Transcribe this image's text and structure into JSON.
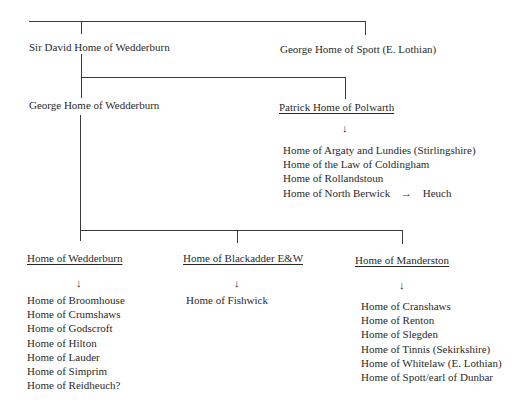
{
  "root": {
    "children": [
      "Sir David Home of Wedderburn",
      "George Home of Spott (E. Lothian)"
    ]
  },
  "sir_david": {
    "name": "Sir David Home of Wedderburn",
    "children": [
      "George Home of Wedderburn",
      "Patrick Home of Polwarth"
    ]
  },
  "george_spott": {
    "name": "George Home of Spott (E. Lothian)"
  },
  "george_wedderburn": {
    "name": "George Home of Wedderburn",
    "children": [
      "Home of Wedderburn",
      "Home of Blackadder E&W",
      "Home of Manderston"
    ]
  },
  "polwarth": {
    "name": "Patrick Home of Polwarth",
    "arrow": "↓",
    "descendants": [
      "Home of Argaty and Lundies (Stirlingshire)",
      "Home of the Law of Coldingham",
      "Home of Rollandstoun",
      "Home of North Berwick"
    ],
    "north_berwick_arrow": "→",
    "north_berwick_to": "Heuch"
  },
  "wedderburn": {
    "name": "Home of Wedderburn",
    "arrow": "↓",
    "descendants": [
      "Home of Broomhouse",
      "Home of Crumshaws",
      "Home of Godscroft",
      "Home of Hilton",
      "Home of Lauder",
      "Home of Simprim",
      "Home of Reidheuch?"
    ]
  },
  "blackadder": {
    "name": "Home of Blackadder E&W",
    "arrow": "↓",
    "descendants": [
      "Home of Fishwick"
    ]
  },
  "manderston": {
    "name": "Home of Manderston",
    "arrow": "↓",
    "descendants": [
      "Home of Cranshaws",
      "Home of Renton",
      "Home of Slegden",
      "Home of Tinnis (Sekirkshire)",
      "Home of Whitelaw (E. Lothian)",
      "Home of Spott/earl of Dunbar"
    ]
  }
}
